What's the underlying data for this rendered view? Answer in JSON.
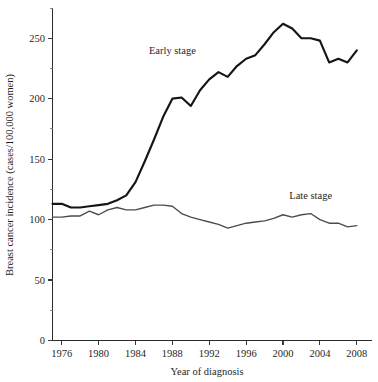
{
  "chart_data": {
    "type": "line",
    "title": "",
    "xlabel": "Year of diagnosis",
    "ylabel": "Breast cancer incidence (cases/100,000 women)",
    "xlim": [
      1975,
      2009
    ],
    "ylim": [
      0,
      275
    ],
    "grid": false,
    "legend_position": "inline-annotation",
    "x": [
      1975,
      1976,
      1977,
      1978,
      1979,
      1980,
      1981,
      1982,
      1983,
      1984,
      1985,
      1986,
      1987,
      1988,
      1989,
      1990,
      1991,
      1992,
      1993,
      1994,
      1995,
      1996,
      1997,
      1998,
      1999,
      2000,
      2001,
      2002,
      2003,
      2004,
      2005,
      2006,
      2007,
      2008
    ],
    "xticks": [
      1976,
      1980,
      1984,
      1988,
      1992,
      1996,
      2000,
      2004,
      2008
    ],
    "xtick_labels": [
      "1976",
      "1980",
      "1984",
      "1988",
      "1992",
      "1996",
      "2000",
      "2004",
      "2008"
    ],
    "yticks": [
      0,
      50,
      100,
      150,
      200,
      250
    ],
    "ytick_labels": [
      "0",
      "50",
      "100",
      "150",
      "200",
      "250"
    ],
    "yticks_minor": [
      25,
      75,
      125,
      175,
      225,
      275
    ],
    "series": [
      {
        "name": "Early stage",
        "color": "#151515",
        "line_width": 2.15,
        "annotation_label": "Early stage",
        "annotation_x": 1988,
        "annotation_y": 237,
        "values": [
          113,
          113,
          110,
          110,
          111,
          112,
          113,
          116,
          120,
          131,
          148,
          166,
          185,
          200,
          201,
          194,
          207,
          216,
          222,
          218,
          227,
          233,
          236,
          245,
          255,
          262,
          258,
          250,
          250,
          248,
          230,
          233,
          230,
          240
        ]
      },
      {
        "name": "Late stage",
        "color": "#4c4c4c",
        "line_width": 1.35,
        "annotation_label": "Late stage",
        "annotation_x": 2003,
        "annotation_y": 117,
        "values": [
          102,
          102,
          103,
          103,
          107,
          104,
          108,
          110,
          108,
          108,
          110,
          112,
          112,
          111,
          105,
          102,
          100,
          98,
          96,
          93,
          95,
          97,
          98,
          99,
          101,
          104,
          102,
          104,
          105,
          100,
          97,
          97,
          94,
          95
        ]
      }
    ]
  }
}
